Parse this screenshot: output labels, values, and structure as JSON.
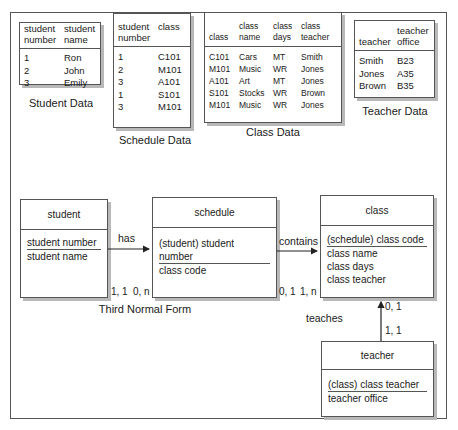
{
  "tables": {
    "student": {
      "caption": "Student Data",
      "headers": [
        [
          "student",
          "number"
        ],
        [
          "student",
          "name"
        ]
      ],
      "rows": [
        [
          "1",
          "Ron"
        ],
        [
          "2",
          "John"
        ],
        [
          "3",
          "Emily"
        ]
      ]
    },
    "schedule": {
      "caption": "Schedule Data",
      "headers": [
        [
          "student",
          "number"
        ],
        [
          "class",
          ""
        ]
      ],
      "rows": [
        [
          "1",
          "C101"
        ],
        [
          "2",
          "M101"
        ],
        [
          "3",
          "A101"
        ],
        [
          "1",
          "S101"
        ],
        [
          "3",
          "M101"
        ]
      ]
    },
    "class": {
      "caption": "Class Data",
      "headers": [
        [
          "",
          "class"
        ],
        [
          "class",
          "name"
        ],
        [
          "class",
          "days"
        ],
        [
          "class",
          "teacher"
        ]
      ],
      "rows": [
        [
          "C101",
          "Cars",
          "MT",
          "Smith"
        ],
        [
          "M101",
          "Music",
          "WR",
          "Jones"
        ],
        [
          "A101",
          "Art",
          "MT",
          "Jones"
        ],
        [
          "S101",
          "Stocks",
          "WR",
          "Brown"
        ],
        [
          "M101",
          "Music",
          "WR",
          "Jones"
        ]
      ]
    },
    "teacher": {
      "caption": "Teacher Data",
      "headers": [
        [
          "",
          "teacher"
        ],
        [
          "teacher",
          "office"
        ]
      ],
      "rows": [
        [
          "Smith",
          "B23"
        ],
        [
          "Jones",
          "A35"
        ],
        [
          "Brown",
          "B35"
        ]
      ]
    }
  },
  "entities": {
    "student": {
      "title": "student",
      "key": "student number",
      "attrs": [
        "student name"
      ]
    },
    "schedule": {
      "title": "schedule",
      "key": "(student) student number",
      "attrs": [
        "class code"
      ]
    },
    "class": {
      "title": "class",
      "key": "(schedule) class code",
      "attrs": [
        "class name",
        "class days",
        "class teacher"
      ]
    },
    "teacher": {
      "title": "teacher",
      "key": "(class) class teacher",
      "attrs": [
        "teacher office"
      ]
    }
  },
  "relationships": {
    "has": {
      "label": "has",
      "card_from": "1, 1",
      "card_to": "0, n"
    },
    "contains": {
      "label": "contains",
      "card_from": "0, 1",
      "card_to": "1, n"
    },
    "teaches": {
      "label": "teaches",
      "card_from": "1, 1",
      "card_to": "0, 1"
    }
  },
  "diagram_caption": "Third Normal Form"
}
